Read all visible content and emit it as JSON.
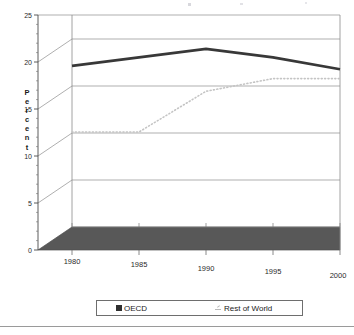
{
  "chart_data": {
    "type": "line",
    "title": "",
    "xlabel": "",
    "ylabel": "Percent",
    "x": [
      1980,
      1985,
      1990,
      1995,
      2000
    ],
    "categories": [
      "1980",
      "1985",
      "1990",
      "1995",
      "2000"
    ],
    "xtick_labels": [
      "1980",
      "1985",
      "1990",
      "1995",
      "2000"
    ],
    "ytick_labels": [
      "0",
      "5",
      "10",
      "15",
      "20",
      "25"
    ],
    "ytick_values": [
      0,
      5,
      10,
      15,
      20,
      25
    ],
    "ylim": [
      0,
      25
    ],
    "xlim": [
      1980,
      2000
    ],
    "grid": true,
    "legend_position": "bottom",
    "style": "3d-perspective",
    "series": [
      {
        "name": "OECD",
        "values": [
          19.0,
          20.0,
          21.0,
          20.0,
          18.6
        ],
        "color": "#383838",
        "line_style": "solid",
        "marker": "filled-square"
      },
      {
        "name": "Rest of World",
        "values": [
          11.2,
          11.2,
          16.0,
          17.5,
          17.5
        ],
        "color": "#c4c4c4",
        "line_style": "dotted",
        "marker": "dotted-line"
      }
    ]
  },
  "axis": {
    "y_title": "Percent",
    "y_title_chars": [
      "P",
      "e",
      "r",
      "c",
      "e",
      "n",
      "t"
    ]
  },
  "legend": {
    "items": [
      {
        "label": "OECD",
        "swatch": "filled-square-icon",
        "color": "#2f2f2f"
      },
      {
        "label": "Rest of World",
        "swatch": "dotted-line-icon",
        "color": "#b9b9b9"
      }
    ]
  },
  "colors": {
    "floor": "#585858",
    "oecd_line": "#383838",
    "row_line": "#c9c9c9",
    "gridline": "#8c8c8c",
    "axis": "#4a4a4a",
    "background": "#ffffff"
  }
}
